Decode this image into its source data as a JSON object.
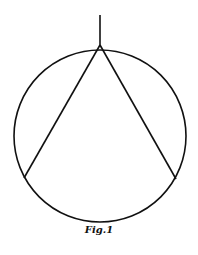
{
  "figure": {
    "caption": "Fig.1",
    "stroke_color": "#111111",
    "background": "#ffffff",
    "circle": {
      "cx": 100,
      "cy": 136,
      "r": 86
    },
    "vertical_line": {
      "x1": 100,
      "y1": 15,
      "x2": 100,
      "y2": 45
    },
    "chords": [
      {
        "x1": 100,
        "y1": 45,
        "x2": 24,
        "y2": 178
      },
      {
        "x1": 100,
        "y1": 45,
        "x2": 176,
        "y2": 179
      }
    ]
  }
}
